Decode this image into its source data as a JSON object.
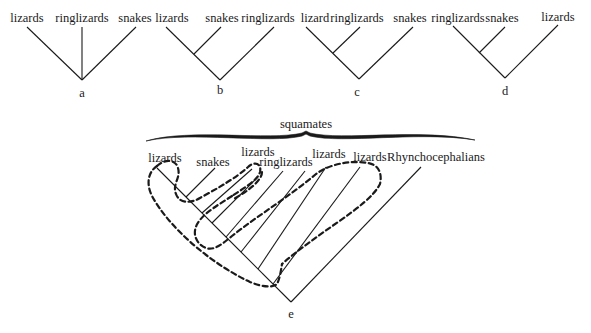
{
  "figure": {
    "trees": [
      {
        "id": "a",
        "sublabel": "a",
        "taxa": [
          "lizards",
          "ringlizards",
          "snakes"
        ],
        "topology": "unresolved trichotomy"
      },
      {
        "id": "b",
        "sublabel": "b",
        "taxa": [
          "lizards",
          "snakes",
          "ringlizards"
        ],
        "topology": "(lizards, snakes), ringlizards"
      },
      {
        "id": "c",
        "sublabel": "c",
        "taxa": [
          "lizard",
          "ringlizards",
          "snakes"
        ],
        "topology": "(lizard, ringlizards), snakes"
      },
      {
        "id": "d",
        "sublabel": "d",
        "taxa": [
          "ringlizards",
          "snakes",
          "lizards"
        ],
        "topology": "(ringlizards, snakes), lizards"
      }
    ],
    "tree_e": {
      "sublabel": "e",
      "group_label": "squamates",
      "taxa": [
        "lizards",
        "snakes",
        "lizards",
        "ringlizards",
        "lizards",
        "lizards",
        "Rhynchocephalians"
      ],
      "note": "dashed outlines enclose paraphyletic 'lizard' groupings"
    }
  }
}
